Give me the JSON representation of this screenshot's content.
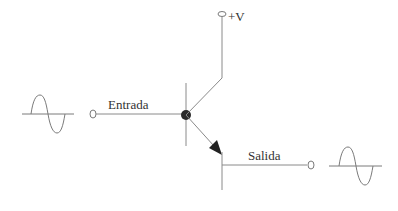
{
  "diagram": {
    "labels": {
      "supply": "+V",
      "input": "Entrada",
      "output": "Salida"
    },
    "components": {
      "transistor": "NPN",
      "input_signal": "sine-wave",
      "output_signal": "sine-wave"
    },
    "colors": {
      "wire": "#8a8a8a",
      "node": "#2a2a2a",
      "text": "#333333",
      "background": "#ffffff"
    }
  }
}
